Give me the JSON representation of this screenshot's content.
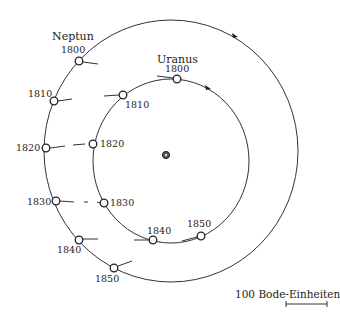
{
  "diagram": {
    "sun": {
      "x": 166,
      "y": 155
    },
    "orbits": {
      "outer": {
        "name": "Neptun",
        "cx": 171,
        "cy": 151,
        "rx": 127,
        "ry": 131
      },
      "inner": {
        "name": "Uranus",
        "cx": 171,
        "cy": 161,
        "rx": 78,
        "ry": 82
      }
    },
    "labels": {
      "neptun": "Neptun",
      "uranus": "Uranus",
      "scale": "100 Bode-Einheiten"
    },
    "neptun_positions": [
      {
        "year": "1800",
        "x": 79,
        "y": 61,
        "lx": 54,
        "ly": 51
      },
      {
        "year": "1810",
        "x": 54,
        "y": 101,
        "lx": 28,
        "ly": 98
      },
      {
        "year": "1820",
        "x": 46,
        "y": 148,
        "lx": 16,
        "ly": 152
      },
      {
        "year": "1830",
        "x": 56,
        "y": 201,
        "lx": 27,
        "ly": 204
      },
      {
        "year": "1840",
        "x": 79,
        "y": 240,
        "lx": 57,
        "ly": 254
      },
      {
        "year": "1850",
        "x": 114,
        "y": 268,
        "lx": 95,
        "ly": 283
      }
    ],
    "uranus_positions": [
      {
        "year": "1800",
        "x": 177,
        "y": 79,
        "lx": 164,
        "ly": 72
      },
      {
        "year": "1810",
        "x": 123,
        "y": 95,
        "lx": 126,
        "ly": 109
      },
      {
        "year": "1820",
        "x": 93,
        "y": 144,
        "lx": 101,
        "ly": 147
      },
      {
        "year": "1830",
        "x": 104,
        "y": 203,
        "lx": 110,
        "ly": 206
      },
      {
        "year": "1840",
        "x": 153,
        "y": 240,
        "lx": 148,
        "ly": 234
      },
      {
        "year": "1850",
        "x": 201,
        "y": 236,
        "lx": 188,
        "ly": 227
      }
    ]
  }
}
